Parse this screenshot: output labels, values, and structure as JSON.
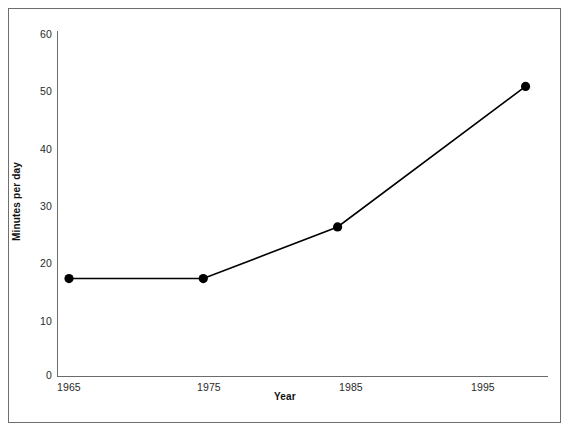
{
  "chart_data": {
    "type": "line",
    "title": "",
    "subtitle": "",
    "xlabel": "Year",
    "ylabel": "Minutes per day",
    "x": [
      1965,
      1975,
      1985,
      1999
    ],
    "values": [
      17,
      17,
      26,
      50.5
    ],
    "series": [
      {
        "name": "Minutes per day",
        "x": [
          1965,
          1975,
          1985,
          1999
        ],
        "values": [
          17,
          17,
          26,
          50.5
        ],
        "color": "#000000",
        "marker": "filled-circle"
      }
    ],
    "xlim": [
      1965,
      2000
    ],
    "ylim": [
      0,
      60
    ],
    "xticks": [
      1965,
      1975,
      1985,
      1995
    ],
    "yticks": [
      0,
      10,
      20,
      30,
      40,
      50,
      60
    ],
    "xticklabels": [
      "1965",
      "1975",
      "1985",
      "1995"
    ],
    "yticklabels": [
      "0",
      "10",
      "20",
      "30",
      "40",
      "50",
      "60"
    ],
    "grid": false,
    "legend": false,
    "legend_position": "none",
    "annotations": []
  },
  "axes": {
    "y": {
      "title": "Minutes per day",
      "ticks": [
        {
          "label": "60",
          "value": 60
        },
        {
          "label": "50",
          "value": 50
        },
        {
          "label": "40",
          "value": 40
        },
        {
          "label": "30",
          "value": 30
        },
        {
          "label": "20",
          "value": 20
        },
        {
          "label": "10",
          "value": 10
        },
        {
          "label": "0",
          "value": 0
        }
      ]
    },
    "x": {
      "title": "Year",
      "ticks": [
        {
          "label": "1965",
          "value": 1965
        },
        {
          "label": "1975",
          "value": 1975
        },
        {
          "label": "1985",
          "value": 1985
        },
        {
          "label": "1995",
          "value": 1995
        }
      ]
    }
  },
  "style": {
    "line_color": "#000000",
    "marker_color": "#000000",
    "axis_color": "#6b6b6b",
    "frame_color": "#6e6e6e",
    "background": "#ffffff",
    "text_color": "#2a2a2a"
  }
}
